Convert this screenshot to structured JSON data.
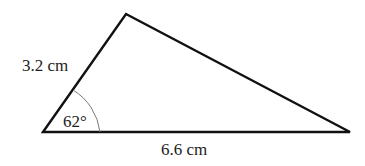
{
  "figure": {
    "type": "triangle",
    "labels": {
      "side_left": "3.2 cm",
      "side_bottom": "6.6 cm",
      "angle": "62°"
    },
    "colors": {
      "stroke": "#111111",
      "arc": "#777777",
      "text": "#222222"
    }
  }
}
